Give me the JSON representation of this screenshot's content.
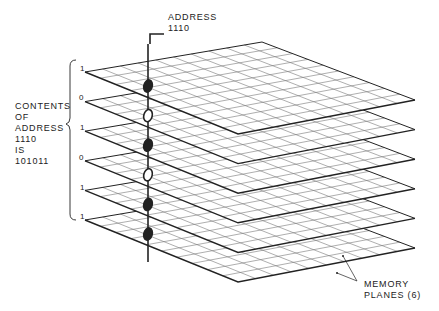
{
  "address_label": {
    "line1": "ADDRESS",
    "line2": "1110"
  },
  "contents_label": [
    "CONTENTS",
    "OF",
    "ADDRESS",
    "1110",
    "IS",
    "101011"
  ],
  "memory_label": {
    "line1": "MEMORY",
    "line2": "PLANES (6)"
  },
  "planes": {
    "count": 6,
    "grid_divisions": 10
  },
  "bits": [
    "1",
    "0",
    "1",
    "0",
    "1",
    "1"
  ],
  "colors": {
    "line": "#222222",
    "grid": "#777777",
    "background": "#ffffff"
  }
}
